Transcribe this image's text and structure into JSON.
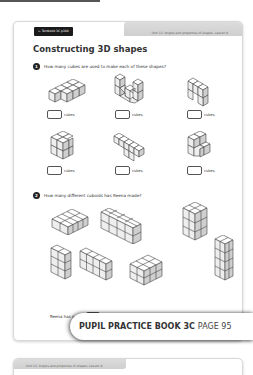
{
  "page": {
    "textbook_tag": "← Textbook 3C p108",
    "unit_label": "Unit 12: Angles and properties of shapes, Lesson 9",
    "title": "Constructing 3D shapes",
    "page_number": "95"
  },
  "question1": {
    "number": "1",
    "text": "How many cubes are used to make each of these shapes?",
    "answers": [
      {
        "unit": "cubes"
      },
      {
        "unit": "cubes"
      },
      {
        "unit": "cubes"
      },
      {
        "unit": "cubes"
      },
      {
        "unit": "cubes"
      },
      {
        "unit": "cubes"
      }
    ]
  },
  "question2": {
    "number": "2",
    "text": "How many different cuboids has Reena made?",
    "answer_prefix": "Reena has made",
    "answer_suffix": "different cuboids."
  },
  "banner": {
    "book": "PUPIL PRACTICE BOOK 3C",
    "page": "PAGE 95"
  },
  "next_page": {
    "unit_label": "Unit 12: Angles and properties of shapes, Lesson 9"
  },
  "colors": {
    "ink": "#333333",
    "cube_face_top": "#ffffff",
    "cube_face_front": "#eeeeee",
    "cube_face_side": "#cfcfcf",
    "header_band": "#d4d4d4"
  }
}
